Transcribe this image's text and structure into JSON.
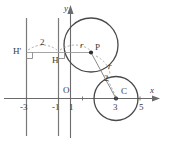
{
  "figure": {
    "kind": "geometry-diagram",
    "colors": {
      "stroke": "#4a4a4a",
      "axis": "#6b6b6b",
      "label": "#3a3a3a",
      "background": "#ffffff",
      "dashed": "#8a8a8a"
    },
    "axes": {
      "x_label": "x",
      "y_label": "y",
      "origin_label": "O"
    },
    "x_ticks": [
      {
        "label": "-3"
      },
      {
        "label": "-1"
      },
      {
        "label": "1"
      },
      {
        "label": "3"
      },
      {
        "label": "5"
      }
    ],
    "points": [
      {
        "name": "P",
        "label": "P"
      },
      {
        "name": "C",
        "label": "C"
      },
      {
        "name": "H",
        "label": "H"
      },
      {
        "name": "H-prime",
        "label": "H'"
      }
    ],
    "segment_labels": [
      {
        "name": "distance-h-hprime",
        "label": "2"
      },
      {
        "name": "radius-ph",
        "label": "r"
      },
      {
        "name": "radius-pc-upper",
        "label": "r"
      },
      {
        "name": "radius-circle-c",
        "label": "2"
      }
    ],
    "vertical_lines": [
      {
        "name": "line-x-minus-3",
        "label": "-3"
      },
      {
        "name": "line-x-minus-1",
        "label": "-1"
      }
    ]
  }
}
